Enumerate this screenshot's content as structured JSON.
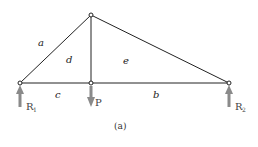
{
  "diagram": {
    "type": "truss",
    "caption": "(a)",
    "caption_letter": "a",
    "nodes": [
      {
        "id": "left-support",
        "x": 20,
        "y": 83
      },
      {
        "id": "apex",
        "x": 91,
        "y": 15
      },
      {
        "id": "mid-bottom",
        "x": 91,
        "y": 83
      },
      {
        "id": "right-support",
        "x": 229,
        "y": 83
      }
    ],
    "regions": [
      {
        "label": "a",
        "x": 40,
        "y": 46
      },
      {
        "label": "d",
        "x": 67,
        "y": 62
      },
      {
        "label": "e",
        "x": 124,
        "y": 63
      },
      {
        "label": "c",
        "x": 56,
        "y": 98
      },
      {
        "label": "b",
        "x": 154,
        "y": 98
      }
    ],
    "forces": [
      {
        "label": "R",
        "subscript": "1",
        "direction": "up"
      },
      {
        "label": "P",
        "subscript": "",
        "direction": "down"
      },
      {
        "label": "R",
        "subscript": "2",
        "direction": "up"
      }
    ],
    "colors": {
      "member": "#222222",
      "force_arrow": "#8a8a8a",
      "label": "#222222"
    }
  }
}
